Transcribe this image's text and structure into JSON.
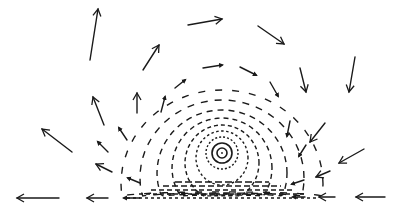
{
  "diagram": {
    "title": "",
    "width": 395,
    "height": 212,
    "stroke_color": "#1a1a1a",
    "background": "#ffffff",
    "vortex_center": {
      "x": 222,
      "y": 153
    },
    "wall_y": 198,
    "inner_rings": [
      {
        "r": 5,
        "style": "solid",
        "stroke_width": 1.6
      },
      {
        "r": 10,
        "style": "solid",
        "stroke_width": 1.6
      },
      {
        "r": 16,
        "style": "dashed",
        "stroke_width": 1.4
      }
    ],
    "arrows": [
      {
        "x1": 90,
        "y1": 60,
        "x2": 98,
        "y2": 9
      },
      {
        "x1": 143,
        "y1": 70,
        "x2": 159,
        "y2": 45
      },
      {
        "x1": 188,
        "y1": 25,
        "x2": 222,
        "y2": 19
      },
      {
        "x1": 258,
        "y1": 26,
        "x2": 284,
        "y2": 44
      },
      {
        "x1": 355,
        "y1": 57,
        "x2": 349,
        "y2": 92
      },
      {
        "x1": 300,
        "y1": 68,
        "x2": 306,
        "y2": 92
      },
      {
        "x1": 72,
        "y1": 152,
        "x2": 42,
        "y2": 129
      },
      {
        "x1": 104,
        "y1": 125,
        "x2": 93,
        "y2": 97
      },
      {
        "x1": 137,
        "y1": 113,
        "x2": 137,
        "y2": 93
      },
      {
        "x1": 364,
        "y1": 149,
        "x2": 339,
        "y2": 163
      },
      {
        "x1": 325,
        "y1": 123,
        "x2": 310,
        "y2": 142
      },
      {
        "x1": 59,
        "y1": 198,
        "x2": 17,
        "y2": 198
      },
      {
        "x1": 385,
        "y1": 197,
        "x2": 356,
        "y2": 197
      },
      {
        "x1": 108,
        "y1": 198,
        "x2": 87,
        "y2": 198
      },
      {
        "x1": 335,
        "y1": 197,
        "x2": 319,
        "y2": 197
      },
      {
        "x1": 112,
        "y1": 172,
        "x2": 96,
        "y2": 164
      },
      {
        "x1": 330,
        "y1": 171,
        "x2": 316,
        "y2": 177
      }
    ],
    "small_arrows": [
      {
        "x1": 175,
        "y1": 88,
        "x2": 185,
        "y2": 80
      },
      {
        "x1": 203,
        "y1": 68,
        "x2": 222,
        "y2": 65
      },
      {
        "x1": 240,
        "y1": 67,
        "x2": 256,
        "y2": 75
      },
      {
        "x1": 270,
        "y1": 82,
        "x2": 278,
        "y2": 96
      },
      {
        "x1": 161,
        "y1": 112,
        "x2": 165,
        "y2": 97
      },
      {
        "x1": 127,
        "y1": 140,
        "x2": 119,
        "y2": 128
      },
      {
        "x1": 108,
        "y1": 152,
        "x2": 98,
        "y2": 142
      },
      {
        "x1": 290,
        "y1": 121,
        "x2": 287,
        "y2": 136
      },
      {
        "x1": 306,
        "y1": 145,
        "x2": 299,
        "y2": 156
      },
      {
        "x1": 140,
        "y1": 198,
        "x2": 124,
        "y2": 198
      },
      {
        "x1": 305,
        "y1": 197,
        "x2": 293,
        "y2": 197
      },
      {
        "x1": 140,
        "y1": 183,
        "x2": 128,
        "y2": 178
      },
      {
        "x1": 304,
        "y1": 180,
        "x2": 292,
        "y2": 184
      }
    ],
    "dashed_streamlines": [
      {
        "cx": 222,
        "cy": 158,
        "rx": 26,
        "ry": 27,
        "dash": "2.5,2.5"
      },
      {
        "cx": 222,
        "cy": 163,
        "rx": 37,
        "ry": 38,
        "dash": "4,3"
      },
      {
        "cx": 222,
        "cy": 168,
        "rx": 50,
        "ry": 50,
        "dash": "5,4"
      },
      {
        "cx": 222,
        "cy": 173,
        "rx": 65,
        "ry": 63,
        "dash": "6,5"
      },
      {
        "cx": 222,
        "cy": 178,
        "rx": 82,
        "ry": 78,
        "dash": "7,7"
      },
      {
        "cx": 222,
        "cy": 184,
        "rx": 101,
        "ry": 94,
        "dash": "7,10"
      }
    ],
    "radial_spokes_count": 14
  }
}
